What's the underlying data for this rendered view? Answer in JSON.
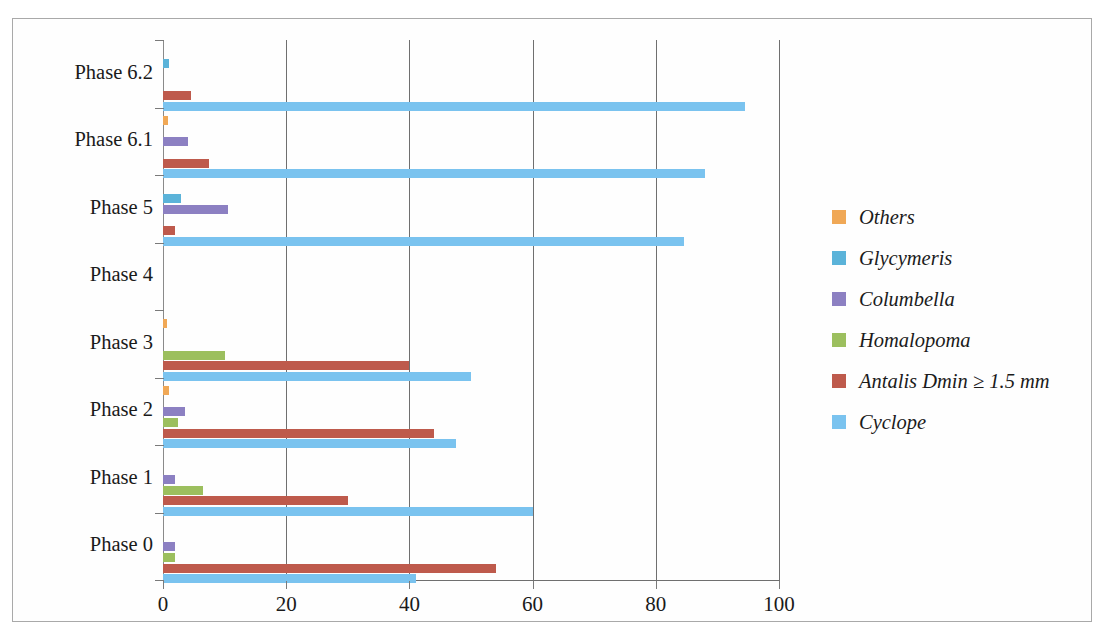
{
  "chart_data": {
    "type": "bar",
    "orientation": "horizontal",
    "title": "",
    "xlabel": "",
    "ylabel": "",
    "xlim": [
      0,
      100
    ],
    "xticks": [
      0,
      20,
      40,
      60,
      80,
      100
    ],
    "xtick_labels": [
      "0",
      "20",
      "40",
      "60",
      "80",
      "100"
    ],
    "grid": true,
    "legend_position": "right",
    "categories": [
      "Phase 6.2",
      "Phase 6.1",
      "Phase 5",
      "Phase 4",
      "Phase 3",
      "Phase 2",
      "Phase 1",
      "Phase 0"
    ],
    "series": [
      {
        "name": "Others",
        "color": "#F0A856",
        "values": [
          0,
          0.8,
          0,
          0,
          0.7,
          1.0,
          0,
          0
        ]
      },
      {
        "name": "Glycymeris",
        "color": "#5BB3D9",
        "values": [
          1.0,
          0,
          3.0,
          0,
          0,
          0,
          0,
          0
        ]
      },
      {
        "name": "Columbella",
        "color": "#8C80C2",
        "values": [
          0,
          4.0,
          10.5,
          0,
          0,
          3.5,
          2.0,
          2.0
        ]
      },
      {
        "name": "Homalopoma",
        "color": "#9CBF5E",
        "values": [
          0,
          0,
          0,
          0,
          10.0,
          2.5,
          6.5,
          2.0
        ]
      },
      {
        "name": "Antalis Dmin ≥ 1.5 mm",
        "color": "#BE5A4C",
        "values": [
          4.5,
          7.5,
          2.0,
          0,
          40.0,
          44.0,
          30.0,
          54.0
        ]
      },
      {
        "name": "Cyclope",
        "color": "#7AC3EF",
        "values": [
          94.5,
          88.0,
          84.5,
          0,
          50.0,
          47.5,
          60.0,
          41.0
        ]
      }
    ],
    "legend_entries": [
      {
        "label": "Others",
        "color": "#F0A856"
      },
      {
        "label": "Glycymeris",
        "color": "#5BB3D9"
      },
      {
        "label": "Columbella",
        "color": "#8C80C2"
      },
      {
        "label": "Homalopoma",
        "color": "#9CBF5E"
      },
      {
        "label": "Antalis Dmin ≥ 1.5 mm",
        "color": "#BE5A4C"
      },
      {
        "label": "Cyclope",
        "color": "#7AC3EF"
      }
    ]
  }
}
